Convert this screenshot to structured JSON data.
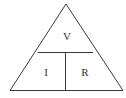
{
  "diagram": {
    "labels": {
      "top": "V",
      "bottom_left": "I",
      "bottom_right": "R"
    },
    "colors": {
      "line": "#3a3a3a",
      "text": "#333333",
      "background": "#ffffff"
    }
  }
}
